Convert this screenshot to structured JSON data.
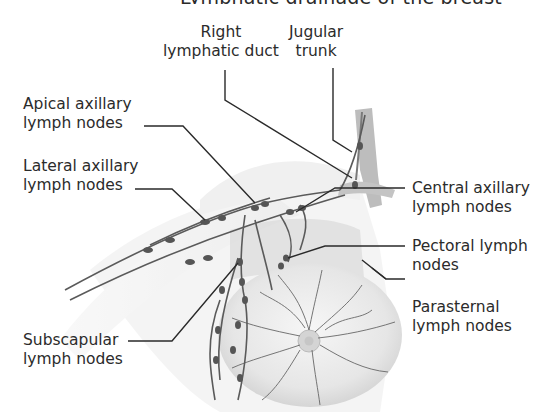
{
  "figure": {
    "title_cropped": "Lymphatic drainage of the breast",
    "labels": {
      "right_lymphatic_duct": [
        "Right",
        "lymphatic duct"
      ],
      "jugular_trunk": [
        "Jugular",
        "trunk"
      ],
      "apical_axillary": [
        "Apical axillary",
        "lymph nodes"
      ],
      "lateral_axillary": [
        "Lateral axillary",
        "lymph nodes"
      ],
      "central_axillary": [
        "Central axillary",
        "lymph nodes"
      ],
      "pectoral": [
        "Pectoral lymph",
        "nodes"
      ],
      "parasternal": [
        "Parasternal",
        "lymph nodes"
      ],
      "subscapular": [
        "Subscapular",
        "lymph nodes"
      ]
    },
    "colors": {
      "background": "#ffffff",
      "leader_line": "#2a2a2a",
      "vessel": "#555555",
      "node": "#555555",
      "tissue": "#d8d8d8"
    }
  }
}
